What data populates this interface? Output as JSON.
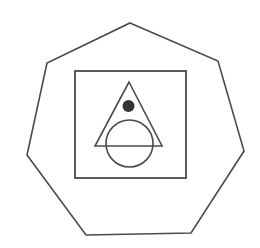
{
  "canvas": {
    "width": 260,
    "height": 248,
    "background": "#ffffff"
  },
  "colors": {
    "stroke": "#4a4a4a",
    "dot_fill": "#333333"
  },
  "diagram": {
    "heptagon": {
      "points": "130,23 218,61 244,151 191,233 86,235 27,155 47,63",
      "stroke_width": 1.6
    },
    "square": {
      "x": 75,
      "y": 71,
      "width": 111,
      "height": 107,
      "stroke_width": 1.8
    },
    "triangle": {
      "points": "129,82 162,146 95,146",
      "stroke_width": 1.6
    },
    "circle": {
      "cx": 129.5,
      "cy": 143.5,
      "r": 23.5,
      "stroke_width": 1.6
    },
    "dot": {
      "cx": 128.5,
      "cy": 106,
      "r": 6
    }
  }
}
